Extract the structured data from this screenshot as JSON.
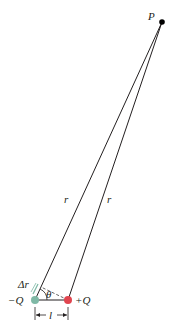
{
  "diagram": {
    "type": "electric-dipole-geometry",
    "labels": {
      "point": "P",
      "r_left": "r",
      "r_right": "r",
      "delta_r": "Δr",
      "theta": "θ",
      "neg_charge": "−Q",
      "pos_charge": "+Q",
      "separation": "l"
    },
    "colors": {
      "line": "#231f20",
      "neg_charge": "#7fb9a6",
      "pos_charge": "#e0454f",
      "point": "#000000",
      "dashed": "#555555"
    },
    "points": {
      "P": [
        162,
        22
      ],
      "neg_charge": [
        35,
        300
      ],
      "pos_charge": [
        68,
        300
      ]
    }
  }
}
